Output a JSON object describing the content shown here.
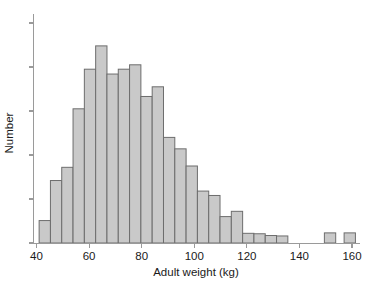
{
  "chart_data": {
    "type": "bar",
    "title": "",
    "xlabel": "Adult weight (kg)",
    "ylabel": "Number",
    "xlim": [
      38,
      162
    ],
    "ylim": [
      0,
      5
    ],
    "grid": false,
    "legend": null,
    "bin_width": 4.3,
    "xticks": [
      40,
      60,
      80,
      100,
      120,
      140,
      160
    ],
    "xtick_labels": [
      "40",
      "60",
      "80",
      "100",
      "120",
      "140",
      "160"
    ],
    "yticks": [
      0,
      1,
      2,
      3,
      4,
      5
    ],
    "ytick_labels": [
      "",
      "",
      "",
      "",
      "",
      ""
    ],
    "bin_starts": [
      41.0,
      45.3,
      49.6,
      53.9,
      58.2,
      62.5,
      66.8,
      71.1,
      75.4,
      79.7,
      84.0,
      88.3,
      92.6,
      96.9,
      101.2,
      105.5,
      109.8,
      114.1,
      118.4,
      122.7,
      127.0,
      131.3,
      149.5,
      157.0
    ],
    "categories": [
      "41-45",
      "45-50",
      "50-54",
      "54-58",
      "58-62",
      "62-67",
      "67-71",
      "71-75",
      "75-80",
      "80-84",
      "84-88",
      "88-93",
      "93-97",
      "97-101",
      "101-105",
      "105-110",
      "110-114",
      "114-118",
      "118-123",
      "123-127",
      "127-131",
      "131-136",
      "149-154",
      "157-160"
    ],
    "values": [
      0.51,
      1.42,
      1.72,
      3.05,
      3.95,
      4.48,
      3.84,
      3.95,
      4.05,
      3.33,
      3.55,
      2.4,
      2.14,
      1.75,
      1.18,
      1.08,
      0.6,
      0.72,
      0.22,
      0.21,
      0.17,
      0.16,
      0.23,
      0.23
    ],
    "series": [
      {
        "name": "Adult weight distribution",
        "values": [
          0.51,
          1.42,
          1.72,
          3.05,
          3.95,
          4.48,
          3.84,
          3.95,
          4.05,
          3.33,
          3.55,
          2.4,
          2.14,
          1.75,
          1.18,
          1.08,
          0.6,
          0.72,
          0.22,
          0.21,
          0.17,
          0.16,
          0.23,
          0.23
        ]
      }
    ],
    "colors": {
      "bar_fill": "#c9c9c9",
      "bar_stroke": "#6d6d6d",
      "axis": "#9a9a9a",
      "text": "#1a1a1a",
      "background": "#ffffff"
    }
  }
}
